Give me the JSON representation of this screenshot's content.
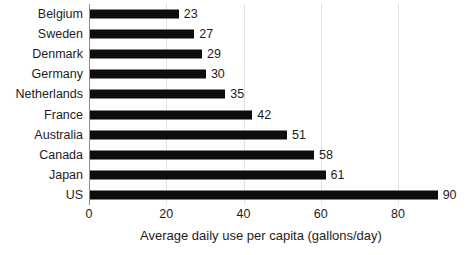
{
  "chart_data": {
    "type": "bar",
    "orientation": "horizontal",
    "title": "",
    "xlabel": "Average daily use per capita (gallons/day)",
    "ylabel": "",
    "categories": [
      "Belgium",
      "Sweden",
      "Denmark",
      "Germany",
      "Netherlands",
      "France",
      "Australia",
      "Canada",
      "Japan",
      "US"
    ],
    "values": [
      23,
      27,
      29,
      30,
      35,
      42,
      51,
      58,
      61,
      90
    ],
    "value_labels": [
      "23",
      "27",
      "29",
      "30",
      "35",
      "42",
      "51",
      "58",
      "61",
      "90"
    ],
    "xlim": [
      0,
      90
    ],
    "xticks": [
      0,
      20,
      40,
      60,
      80
    ],
    "xtick_labels": [
      "0",
      "20",
      "40",
      "60",
      "80"
    ],
    "grid": true,
    "grid_axis": "x",
    "legend": null,
    "bar_color": "#0d0d0d",
    "grid_color": "#e2e2e2",
    "axis_color": "#8d8d8d",
    "background_color": "#ffffff"
  }
}
